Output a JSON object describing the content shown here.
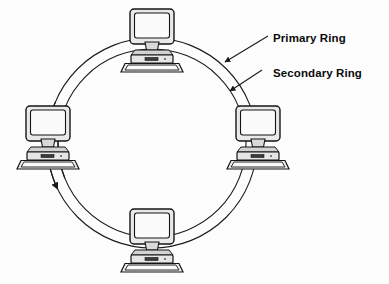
{
  "diagram": {
    "background_color": "#fdfdfd",
    "line_color": "#1a1a1a",
    "labels": {
      "primary_ring": "Primary Ring",
      "secondary_ring": "Secondary Ring"
    },
    "rings": [
      {
        "id": "primary",
        "name": "Primary Ring",
        "radius": 105,
        "direction": "counter-clockwise",
        "arrow_label": "counter-clockwise-flow-arrow"
      },
      {
        "id": "secondary",
        "name": "Secondary Ring",
        "radius": 94,
        "direction": "clockwise",
        "arrow_label": "clockwise-flow-arrow"
      }
    ],
    "center": {
      "x": 152,
      "y": 143
    },
    "nodes": [
      {
        "id": "node-top",
        "position": "top",
        "x": 152,
        "y": 43,
        "icon": "computer-icon"
      },
      {
        "id": "node-right",
        "position": "right",
        "x": 258,
        "y": 140,
        "icon": "computer-icon"
      },
      {
        "id": "node-bottom",
        "position": "bottom",
        "x": 152,
        "y": 243,
        "icon": "computer-icon"
      },
      {
        "id": "node-left",
        "position": "left",
        "x": 48,
        "y": 140,
        "icon": "computer-icon"
      }
    ],
    "leaders": [
      {
        "id": "leader-primary",
        "from_label": "Primary Ring",
        "to_ring": "primary"
      },
      {
        "id": "leader-secondary",
        "from_label": "Secondary Ring",
        "to_ring": "secondary"
      }
    ]
  }
}
